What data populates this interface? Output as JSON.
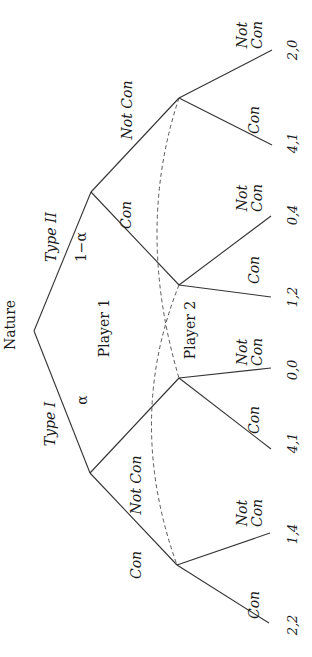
{
  "diagram": {
    "title": "Nature",
    "root_label": "Nature",
    "player1_label": "Player 1",
    "player2_label": "Player 2",
    "nature_moves": [
      {
        "label": "Type II",
        "prob": "1−α"
      },
      {
        "label": "Type I",
        "prob": "α"
      }
    ],
    "player1_actions": {
      "type2": {
        "con": "Con",
        "notcon": "Not Con"
      },
      "type1": {
        "con": "Con",
        "notcon": "Not Con"
      }
    },
    "player2_actions": {
      "not": "Not",
      "con": "Con",
      "con_single": "Con"
    },
    "payoffs": [
      "2,0",
      "4,1",
      "0,4",
      "1,2",
      "0,0",
      "4,1",
      "1,4",
      "2,2"
    ],
    "colors": {
      "line": "#333333",
      "text": "#1a1a1a",
      "background": "#ffffff"
    }
  }
}
